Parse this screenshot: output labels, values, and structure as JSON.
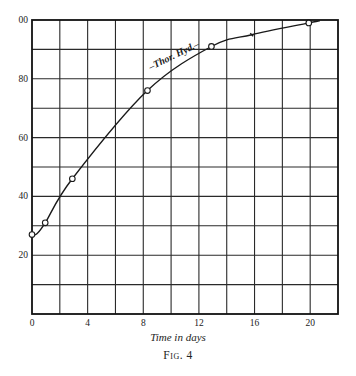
{
  "chart_data": {
    "type": "line",
    "title": "",
    "xlabel": "Time in days",
    "ylabel": "",
    "caption": "Fig. 4",
    "xlim": [
      0,
      22
    ],
    "ylim": [
      0,
      100
    ],
    "x_ticks": [
      0,
      4,
      8,
      12,
      16,
      20
    ],
    "y_ticks": [
      20,
      40,
      60,
      80,
      100
    ],
    "y_tick_labels": [
      "20",
      "40",
      "60",
      "80",
      "00"
    ],
    "grid": {
      "x_step": 2,
      "y_step": 10,
      "on": true
    },
    "legend": null,
    "annotations": [
      {
        "text": "–Thor. Hyd.–",
        "x": 10.3,
        "y": 87,
        "rotation": -26
      }
    ],
    "series": [
      {
        "name": "Thor. Hyd.",
        "marker": "open-circle",
        "x": [
          0,
          0.95,
          2.9,
          8.3,
          12.9,
          19.9
        ],
        "values": [
          27,
          31,
          46,
          76,
          91,
          99
        ]
      }
    ],
    "curve_extra_points": [
      {
        "x": 15.8,
        "y": 95,
        "marker": "tick"
      }
    ]
  },
  "labels": {
    "xlabel": "Time in days",
    "caption": "Fig. 4"
  }
}
